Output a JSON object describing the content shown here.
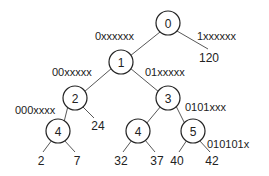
{
  "diagram": {
    "type": "binary-trie",
    "nodes": [
      {
        "id": "n0",
        "label": "0",
        "x": 168,
        "y": 23
      },
      {
        "id": "n1",
        "label": "1",
        "x": 121,
        "y": 62
      },
      {
        "id": "n2",
        "label": "2",
        "x": 75,
        "y": 98
      },
      {
        "id": "n3",
        "label": "3",
        "x": 168,
        "y": 98
      },
      {
        "id": "n4a",
        "label": "4",
        "x": 58,
        "y": 131
      },
      {
        "id": "n4b",
        "label": "4",
        "x": 138,
        "y": 131
      },
      {
        "id": "n5",
        "label": "5",
        "x": 193,
        "y": 131
      }
    ],
    "leaves": [
      {
        "id": "l120",
        "label": "120",
        "x": 209,
        "y": 58
      },
      {
        "id": "l24",
        "label": "24",
        "x": 98,
        "y": 126
      },
      {
        "id": "l2",
        "label": "2",
        "x": 41,
        "y": 161
      },
      {
        "id": "l7",
        "label": "7",
        "x": 77,
        "y": 161
      },
      {
        "id": "l32",
        "label": "32",
        "x": 121,
        "y": 161
      },
      {
        "id": "l37",
        "label": "37",
        "x": 157,
        "y": 161
      },
      {
        "id": "l40",
        "label": "40",
        "x": 177,
        "y": 161
      },
      {
        "id": "l42",
        "label": "42",
        "x": 212,
        "y": 161
      }
    ],
    "edges": [
      {
        "from": [
          160,
          32
        ],
        "to": [
          130,
          56
        ]
      },
      {
        "from": [
          177,
          31
        ],
        "to": [
          208,
          49
        ]
      },
      {
        "from": [
          112,
          68
        ],
        "to": [
          84,
          92
        ]
      },
      {
        "from": [
          130,
          68
        ],
        "to": [
          159,
          92
        ]
      },
      {
        "from": [
          68,
          106
        ],
        "to": [
          64,
          122
        ]
      },
      {
        "from": [
          82,
          106
        ],
        "to": [
          94,
          118
        ]
      },
      {
        "from": [
          161,
          106
        ],
        "to": [
          146,
          124
        ]
      },
      {
        "from": [
          176,
          106
        ],
        "to": [
          185,
          124
        ]
      },
      {
        "from": [
          52,
          140
        ],
        "to": [
          43,
          152
        ]
      },
      {
        "from": [
          64,
          140
        ],
        "to": [
          75,
          152
        ]
      },
      {
        "from": [
          132,
          140
        ],
        "to": [
          123,
          152
        ]
      },
      {
        "from": [
          145,
          140
        ],
        "to": [
          155,
          152
        ]
      },
      {
        "from": [
          187,
          140
        ],
        "to": [
          179,
          152
        ]
      },
      {
        "from": [
          199,
          140
        ],
        "to": [
          210,
          152
        ]
      }
    ],
    "edge_labels": [
      {
        "text": "0xxxxxx",
        "x": 95,
        "y": 36
      },
      {
        "text": "1xxxxxx",
        "x": 197,
        "y": 36
      },
      {
        "text": "00xxxxx",
        "x": 52,
        "y": 72
      },
      {
        "text": "01xxxxx",
        "x": 145,
        "y": 72
      },
      {
        "text": "000xxxx",
        "x": 15,
        "y": 110
      },
      {
        "text": "0101xxx",
        "x": 185,
        "y": 107
      },
      {
        "text": "010101x",
        "x": 207,
        "y": 144
      }
    ],
    "node_radius": 12,
    "colors": {
      "stroke": "#222222",
      "edge": "#444444",
      "text": "#222222",
      "background": "#ffffff"
    }
  }
}
